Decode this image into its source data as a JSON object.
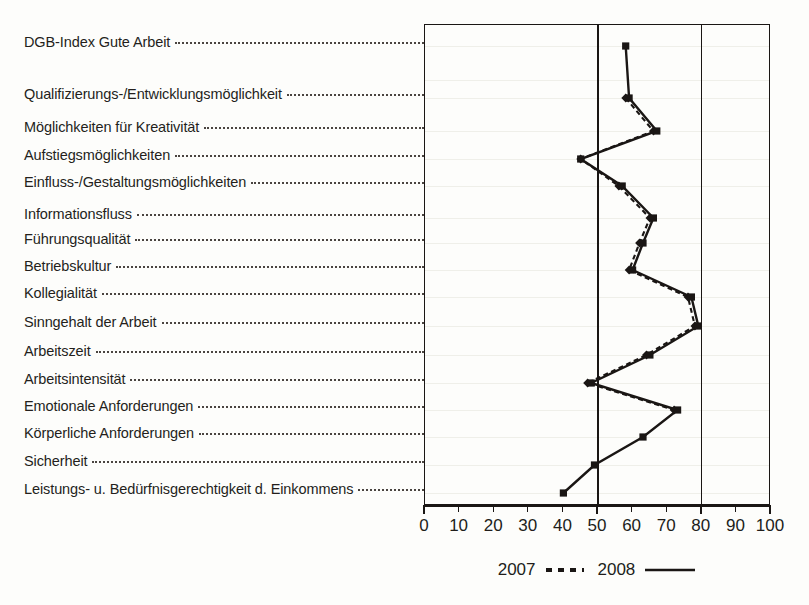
{
  "chart_data": {
    "type": "line",
    "orientation": "horizontal",
    "title": "",
    "xlabel": "",
    "ylabel": "",
    "xlim": [
      0,
      100
    ],
    "xticks": [
      0,
      10,
      20,
      30,
      40,
      50,
      60,
      70,
      80,
      90,
      100
    ],
    "xtick_labels": [
      "0",
      "10",
      "20",
      "30",
      "40",
      "50",
      "60",
      "70",
      "80",
      "90",
      "100"
    ],
    "gridlines_x": [
      50,
      80
    ],
    "grid": true,
    "legend_position": "bottom-center",
    "categories": [
      "DGB-Index Gute Arbeit",
      "",
      "Qualifizierungs-/Entwicklungsmöglichkeit",
      "Möglichkeiten für Kreativität",
      "Aufstiegsmöglichkeiten",
      "Einfluss-/Gestaltungsmöglichkeiten",
      "Informationsfluss",
      "Führungsqualität",
      "Betriebskultur",
      "Kollegialität",
      "Sinngehalt der Arbeit",
      "Arbeitszeit",
      "Arbeitsintensität",
      "Emotionale Anforderungen",
      "Körperliche Anforderungen",
      "Sicherheit",
      "Leistungs- u. Bedürfnisgerechtigkeit d. Einkommens"
    ],
    "series": [
      {
        "name": "2007",
        "style": "dashed",
        "color": "#1a1614",
        "values": [
          null,
          null,
          58,
          66,
          45,
          56,
          65,
          62,
          59,
          76,
          78,
          64,
          47,
          72,
          null,
          null,
          null
        ]
      },
      {
        "name": "2008",
        "style": "solid",
        "color": "#1a1614",
        "values": [
          58,
          null,
          59,
          67,
          45,
          57,
          66,
          63,
          60,
          77,
          79,
          65,
          48,
          73,
          63,
          49,
          40
        ]
      }
    ]
  },
  "labels": {
    "rows": [
      {
        "text": "DGB-Index Gute Arbeit",
        "leader": true
      },
      {
        "text": "Qualifizierungs-/Entwicklungsmöglichkeit",
        "leader": true
      },
      {
        "text": "Möglichkeiten für Kreativität",
        "leader": true
      },
      {
        "text": "Aufstiegsmöglichkeiten",
        "leader": true
      },
      {
        "text": "Einfluss-/Gestaltungsmöglichkeiten",
        "leader": true
      },
      {
        "text": "Informationsfluss",
        "leader": true
      },
      {
        "text": "Führungsqualität",
        "leader": true
      },
      {
        "text": "Betriebskultur",
        "leader": true
      },
      {
        "text": "Kollegialität",
        "leader": true
      },
      {
        "text": "Sinngehalt der Arbeit",
        "leader": true
      },
      {
        "text": "Arbeitszeit",
        "leader": true
      },
      {
        "text": "Arbeitsintensität",
        "leader": true
      },
      {
        "text": "Emotionale Anforderungen",
        "leader": true
      },
      {
        "text": "Körperliche Anforderungen",
        "leader": true
      },
      {
        "text": "Sicherheit",
        "leader": true
      },
      {
        "text": "Leistungs- u. Bedürfnisgerechtigkeit d. Einkommens",
        "leader": true
      }
    ]
  },
  "legend": {
    "items": [
      {
        "label": "2007",
        "style": "dashed"
      },
      {
        "label": "2008",
        "style": "solid"
      }
    ]
  }
}
